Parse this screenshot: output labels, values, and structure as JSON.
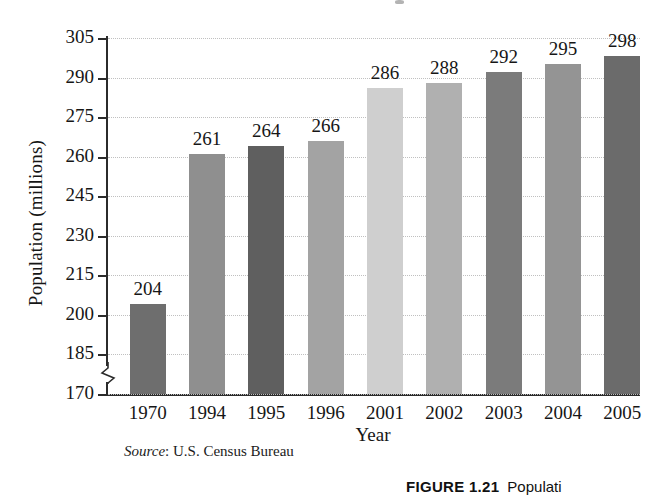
{
  "chart_data": {
    "type": "bar",
    "title": "",
    "xlabel": "Year",
    "ylabel": "Population (millions)",
    "categories": [
      "1970",
      "1994",
      "1995",
      "1996",
      "2001",
      "2002",
      "2003",
      "2004",
      "2005"
    ],
    "values": [
      204,
      261,
      264,
      266,
      286,
      288,
      292,
      295,
      298
    ],
    "value_labels": [
      "204",
      "261",
      "264",
      "266",
      "286",
      "288",
      "292",
      "295",
      "298"
    ],
    "ylim": [
      170,
      305
    ],
    "ytick_labels": [
      "170",
      "185",
      "200",
      "215",
      "230",
      "245",
      "260",
      "275",
      "290",
      "305"
    ],
    "ytick_values": [
      170,
      185,
      200,
      215,
      230,
      245,
      260,
      275,
      290,
      305
    ],
    "axis_break": true,
    "grid": true,
    "grid_style": "dotted",
    "legend": "none",
    "bar_colors": [
      "#6e6e6e",
      "#8f8f8f",
      "#5f5f5f",
      "#a3a3a3",
      "#cfcfcf",
      "#b0b0b0",
      "#7b7b7b",
      "#949494",
      "#6b6b6b"
    ]
  },
  "source": {
    "label": "Source",
    "separator": ":",
    "text": "U.S. Census Bureau"
  },
  "caption": {
    "figure_number": "FIGURE 1.21",
    "figure_text": "Populati"
  },
  "colors": {
    "axis": "#2b2b2b",
    "gridline": "#c0c0c0",
    "text": "#161616",
    "background": "#ffffff"
  }
}
